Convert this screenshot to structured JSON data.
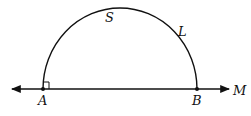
{
  "diagram": {
    "labels": {
      "arc_top": "S",
      "arc_right": "L",
      "point_left": "A",
      "point_right": "B",
      "line_end": "M"
    },
    "colors": {
      "stroke": "#111111",
      "background": "#ffffff"
    },
    "elements": [
      "line through A and B with arrows on both ends, labeled M on right",
      "semicircle arc from A to B labeled S and L",
      "right-angle marker at A"
    ]
  }
}
